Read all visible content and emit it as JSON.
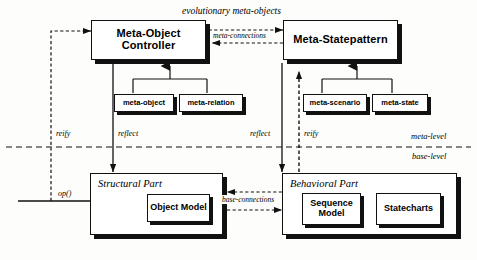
{
  "diagram": {
    "title_annotation": "evolutionary meta-objects",
    "meta_connections_label": "meta-connections",
    "base_connections_label": "base-connections",
    "level_labels": {
      "meta": "meta-level",
      "base": "base-level"
    },
    "operation_label": "op()",
    "relation_labels": {
      "reify_left": "reify",
      "reflect_left": "reflect",
      "reflect_right": "reflect",
      "reify_right": "reify"
    },
    "meta_level": {
      "controllers": [
        {
          "id": "meta-object-controller",
          "label": "Meta-Object Controller"
        },
        {
          "id": "meta-statepattern",
          "label": "Meta-Statepattern"
        }
      ],
      "meta_entities_left": [
        {
          "id": "meta-object",
          "label": "meta-object"
        },
        {
          "id": "meta-relation",
          "label": "meta-relation"
        }
      ],
      "meta_entities_right": [
        {
          "id": "meta-scenario",
          "label": "meta-scenario"
        },
        {
          "id": "meta-state",
          "label": "meta-state"
        }
      ]
    },
    "base_level": {
      "parts": [
        {
          "id": "structural-part",
          "label": "Structural Part",
          "models": [
            {
              "id": "object-model",
              "label": "Object Model"
            }
          ]
        },
        {
          "id": "behavioral-part",
          "label": "Behavioral Part",
          "models": [
            {
              "id": "sequence-model",
              "label": "Sequence\nModel"
            },
            {
              "id": "statecharts",
              "label": "Statecharts"
            }
          ]
        }
      ]
    },
    "colors": {
      "stroke": "#111111",
      "fill": "#ffffff",
      "shadow": "#111111",
      "background": "#fdfdfb"
    }
  }
}
